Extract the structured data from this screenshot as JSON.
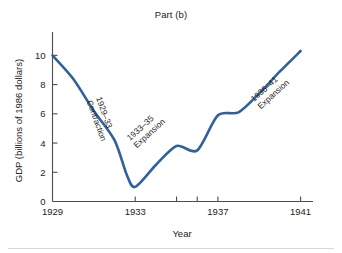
{
  "chart_data": {
    "type": "line",
    "title": "Part (b)",
    "xlabel": "Year",
    "ylabel": "GDP (billions of 1986 dollars)",
    "grid": false,
    "legend": "none",
    "line_color": "#2f629c",
    "xlim": [
      1929,
      1941.6
    ],
    "ylim": [
      0,
      11.6
    ],
    "x_ticks": [
      1929,
      1933,
      1937,
      1941
    ],
    "x_tick_labels": [
      "1929",
      "1933",
      "1937",
      "1941"
    ],
    "x_minor_ticks": [
      1935,
      1936
    ],
    "y_ticks": [
      0,
      2,
      4,
      6,
      8,
      10
    ],
    "y_tick_labels": [
      "0",
      "2",
      "4",
      "6",
      "8",
      "10"
    ],
    "series": [
      {
        "name": "GDP",
        "x": [
          1929,
          1930,
          1931,
          1932,
          1932.6,
          1933,
          1934,
          1935,
          1936,
          1937,
          1938,
          1939,
          1940,
          1941
        ],
        "values": [
          10.0,
          8.4,
          6.2,
          4.2,
          1.8,
          1.0,
          2.5,
          3.8,
          3.5,
          5.9,
          6.1,
          7.4,
          8.9,
          10.3
        ]
      }
    ],
    "annotations": [
      {
        "name": "contraction-1929-33",
        "line1": "1929–33",
        "line2": "Contraction",
        "x": 96,
        "y": 98,
        "rotation": 70
      },
      {
        "name": "expansion-1933-35",
        "line1": "1933–35",
        "line2": "Expansion",
        "x": 130,
        "y": 141,
        "rotation": -42
      },
      {
        "name": "expansion-1936-41",
        "line1": "1936–41",
        "line2": "Expansion",
        "x": 254,
        "y": 102,
        "rotation": -42
      }
    ]
  }
}
